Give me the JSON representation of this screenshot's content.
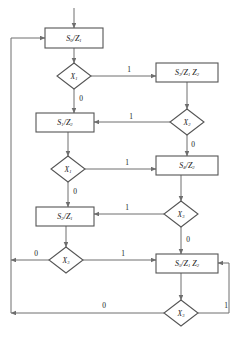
{
  "diagram": {
    "type": "asm-state-flowchart",
    "title": "",
    "colors": {
      "line": "#6e6e6e",
      "box_border": "#555555",
      "text": "#1a1a1a",
      "background": "#ffffff"
    },
    "state_boxes": [
      {
        "id": "s0",
        "label": "S0/Z1",
        "state": "S",
        "state_sub": "0",
        "outputs": "Z1",
        "x": 45,
        "y": 28,
        "w": 58,
        "h": 20
      },
      {
        "id": "s3",
        "label": "S3/Z1 Z2",
        "state": "S",
        "state_sub": "3",
        "outputs": "Z1 Z2",
        "x": 156,
        "y": 63,
        "w": 62,
        "h": 19
      },
      {
        "id": "s1",
        "label": "S1/Z2",
        "state": "S",
        "state_sub": "1",
        "outputs": "Z2",
        "x": 36,
        "y": 113,
        "w": 58,
        "h": 19
      },
      {
        "id": "s4",
        "label": "S4/Z2",
        "state": "S",
        "state_sub": "4",
        "outputs": "Z2",
        "x": 156,
        "y": 156,
        "w": 62,
        "h": 19
      },
      {
        "id": "s2",
        "label": "S2/Z1",
        "state": "S",
        "state_sub": "2",
        "outputs": "Z1",
        "x": 36,
        "y": 207,
        "w": 58,
        "h": 19
      },
      {
        "id": "s5",
        "label": "S5/Z1 Z2",
        "state": "S",
        "state_sub": "5",
        "outputs": "Z1 Z2",
        "x": 156,
        "y": 254,
        "w": 62,
        "h": 19
      }
    ],
    "decision_diamonds": [
      {
        "id": "d_x1_a",
        "label": "X1",
        "var": "X",
        "var_sub": "1",
        "cx": 74,
        "cy": 76,
        "rx": 17,
        "ry": 13
      },
      {
        "id": "d_x2",
        "label": "X2",
        "var": "X",
        "var_sub": "2",
        "cx": 187,
        "cy": 122,
        "rx": 17,
        "ry": 13
      },
      {
        "id": "d_x1_b",
        "label": "X1",
        "var": "X",
        "var_sub": "1",
        "cx": 68,
        "cy": 169,
        "rx": 17,
        "ry": 13
      },
      {
        "id": "d_x3_a",
        "label": "X3",
        "var": "X",
        "var_sub": "3",
        "cx": 181,
        "cy": 214,
        "rx": 17,
        "ry": 13
      },
      {
        "id": "d_x3_b",
        "label": "X3",
        "var": "X",
        "var_sub": "3",
        "cx": 66,
        "cy": 260,
        "rx": 17,
        "ry": 13
      },
      {
        "id": "d_x3_c",
        "label": "X3",
        "var": "X",
        "var_sub": "3",
        "cx": 181,
        "cy": 313,
        "rx": 17,
        "ry": 13
      }
    ],
    "edge_labels": [
      {
        "id": "e_x1a_1",
        "value": "1",
        "x": 129,
        "y": 70
      },
      {
        "id": "e_x1a_0",
        "value": "0",
        "x": 81,
        "y": 99
      },
      {
        "id": "e_x2_1",
        "value": "1",
        "x": 131,
        "y": 117
      },
      {
        "id": "e_x2_0",
        "value": "0",
        "x": 193,
        "y": 145
      },
      {
        "id": "e_x1b_1",
        "value": "1",
        "x": 127,
        "y": 163
      },
      {
        "id": "e_x1b_0",
        "value": "0",
        "x": 75,
        "y": 192
      },
      {
        "id": "e_x3a_1",
        "value": "1",
        "x": 127,
        "y": 208
      },
      {
        "id": "e_x3a_0",
        "value": "0",
        "x": 188,
        "y": 240
      },
      {
        "id": "e_x3b_0",
        "value": "0",
        "x": 36,
        "y": 254
      },
      {
        "id": "e_x3b_1",
        "value": "1",
        "x": 123,
        "y": 254
      },
      {
        "id": "e_x3c_0",
        "value": "0",
        "x": 104,
        "y": 306
      },
      {
        "id": "e_x3c_1",
        "value": "1",
        "x": 226,
        "y": 306
      }
    ]
  }
}
